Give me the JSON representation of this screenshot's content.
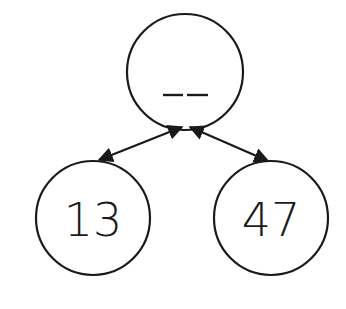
{
  "diagram": {
    "type": "number-bond",
    "whole": {
      "label": "__",
      "value": null
    },
    "parts": [
      {
        "label": "13"
      },
      {
        "label": "47"
      }
    ],
    "colors": {
      "stroke": "#1a1a1a",
      "background": "#ffffff"
    }
  }
}
